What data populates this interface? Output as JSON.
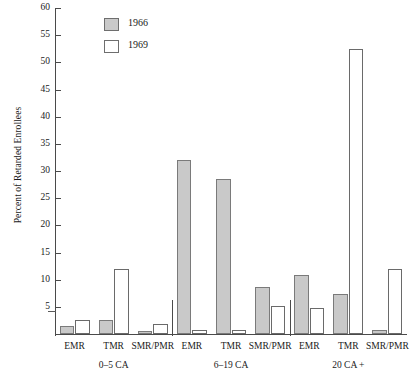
{
  "chart_data": {
    "type": "bar",
    "title": "",
    "xlabel": "",
    "ylabel": "Percent of Retarded Enrollees",
    "ylim": [
      0,
      60
    ],
    "yticks": [
      0,
      5,
      10,
      15,
      20,
      25,
      30,
      35,
      40,
      45,
      50,
      55,
      60
    ],
    "ytick_labels": [
      "",
      "5",
      "10",
      "15",
      "20",
      "25",
      "30",
      "35",
      "40",
      "45",
      "50",
      "55",
      "60"
    ],
    "grid": false,
    "legend_position": "top-left-inside",
    "categories": [
      "EMR",
      "TMR",
      "SMR/PMR",
      "EMR",
      "TMR",
      "SMR/PMR",
      "EMR",
      "TMR",
      "SMR/PMR"
    ],
    "groups": [
      {
        "label": "0–5 CA",
        "categories": [
          "EMR",
          "TMR",
          "SMR/PMR"
        ]
      },
      {
        "label": "6–19 CA",
        "categories": [
          "EMR",
          "TMR",
          "SMR/PMR"
        ]
      },
      {
        "label": "20 CA  +",
        "categories": [
          "EMR",
          "TMR",
          "SMR/PMR"
        ]
      }
    ],
    "series": [
      {
        "name": "1966",
        "color": "#c9c9c9",
        "values": [
          1.5,
          2.6,
          0.6,
          32.0,
          28.5,
          8.7,
          10.8,
          7.3,
          0.7
        ]
      },
      {
        "name": "1969",
        "color": "#ffffff",
        "values": [
          2.6,
          12.0,
          1.8,
          0.8,
          0.7,
          5.2,
          4.7,
          52.5,
          12.0
        ]
      }
    ]
  },
  "legend": {
    "items": [
      {
        "label": "1966",
        "swatch": "filled-gray-swatch"
      },
      {
        "label": "1969",
        "swatch": "empty-white-swatch"
      }
    ]
  }
}
